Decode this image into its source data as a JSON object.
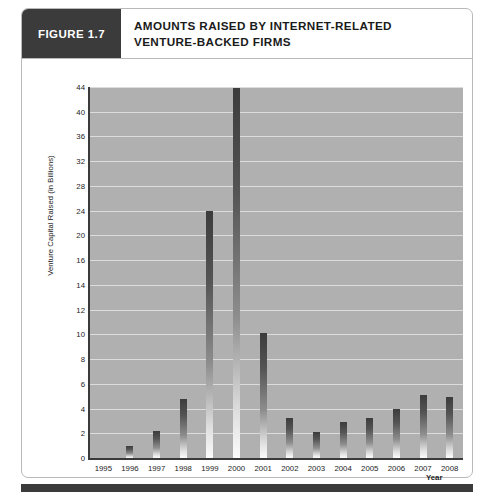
{
  "figure": {
    "tab_label": "FIGURE 1.7",
    "title_line1": "AMOUNTS RAISED BY INTERNET-RELATED",
    "title_line2": "VENTURE-BACKED FIRMS"
  },
  "colors": {
    "tab_background": "#3b3b3b",
    "plot_background": "#b0b0b0",
    "gridline": "#dcdcdc",
    "axis": "#3a3a3a",
    "bar_top": "#3c3c3c",
    "bar_bottom": "#fbfbfb",
    "frame_border": "#b9b9b9",
    "page_background": "#ffffff"
  },
  "chart_data": {
    "type": "bar",
    "title": "AMOUNTS RAISED BY INTERNET-RELATED VENTURE-BACKED FIRMS",
    "xlabel": "Year",
    "ylabel": "Venture Capital Raised (in Billions)",
    "categories": [
      "1995",
      "1996",
      "1997",
      "1998",
      "1999",
      "2000",
      "2001",
      "2002",
      "2003",
      "2004",
      "2005",
      "2006",
      "2007",
      "2008"
    ],
    "values": [
      0,
      1.0,
      2.2,
      4.8,
      24.0,
      43.8,
      10.1,
      3.2,
      2.1,
      2.9,
      3.2,
      4.0,
      5.1,
      4.9
    ],
    "ytick_labels": [
      "0",
      "2",
      "4",
      "6",
      "8",
      "10",
      "12",
      "14",
      "16",
      "20",
      "24",
      "28",
      "32",
      "36",
      "40",
      "44"
    ],
    "ytick_values": [
      0,
      2,
      4,
      6,
      8,
      10,
      12,
      14,
      16,
      20,
      24,
      28,
      32,
      36,
      40,
      44
    ],
    "yscale_note": "non-uniform: equal spacing per tick, 2-unit steps to 16 then 4-unit steps to 44",
    "ylim": [
      0,
      44
    ],
    "grid": "horizontal",
    "legend": "none"
  }
}
